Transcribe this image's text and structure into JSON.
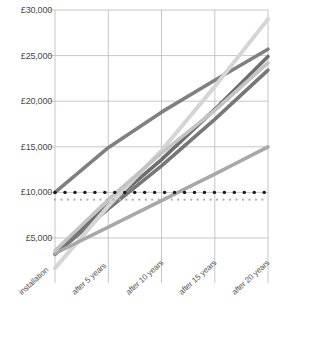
{
  "chart_data": {
    "type": "line",
    "title": "",
    "subtitle": "",
    "xlabel": "",
    "ylabel": "",
    "categories": [
      "installation",
      "after 5 years",
      "after 10 years",
      "after 15 years",
      "after 20 years"
    ],
    "x": [
      0,
      5,
      10,
      15,
      20
    ],
    "ylim": [
      0,
      30000
    ],
    "ytick_labels": [
      "£30,000",
      "£25,000",
      "£20,000",
      "£15,000",
      "£10,000",
      "£5,000"
    ],
    "ytick_values": [
      30000,
      25000,
      20000,
      15000,
      10000,
      5000
    ],
    "grid": true,
    "legend": "none",
    "currency_symbol": "£",
    "series": [
      {
        "name": "series-1-dark-gray-steep-from-10000",
        "color": "#808080",
        "style": "solid",
        "width": 3.6,
        "values": [
          10000,
          14900,
          18800,
          22300,
          25700
        ]
      },
      {
        "name": "series-2-dark-gray-from-3300",
        "color": "#6e6e6e",
        "style": "solid",
        "width": 3.6,
        "values": [
          3300,
          8600,
          13600,
          19100,
          24900
        ]
      },
      {
        "name": "series-3-medium-gray-from-3200",
        "color": "#777777",
        "style": "solid",
        "width": 3.6,
        "values": [
          3200,
          8200,
          12900,
          18000,
          23400
        ]
      },
      {
        "name": "series-4-light-gray-steepest",
        "color": "#d5d5d5",
        "style": "solid",
        "width": 4.0,
        "values": [
          1700,
          8500,
          14600,
          21600,
          29000
        ]
      },
      {
        "name": "series-5-mid-gray-shallow-to-15000",
        "color": "#a8a8a8",
        "style": "solid",
        "width": 3.6,
        "values": [
          3300,
          6200,
          9100,
          12000,
          15000
        ]
      },
      {
        "name": "series-6-light-gray-crossing",
        "color": "#c4c4c4",
        "style": "solid",
        "width": 3.6,
        "values": [
          3600,
          9200,
          14300,
          19000,
          24200
        ]
      },
      {
        "name": "series-7-dotted-flat-10000",
        "color": "#1a1a1a",
        "style": "dotted",
        "width": 3.4,
        "values": [
          10000,
          10000,
          10000,
          10000,
          10000
        ]
      },
      {
        "name": "series-8-dotted-flat-9200",
        "color": "#b0b0b0",
        "style": "dotted",
        "width": 2.2,
        "values": [
          9200,
          9200,
          9200,
          9200,
          9200
        ]
      }
    ]
  },
  "axes": {
    "plot_left_px": 55,
    "plot_right_px": 268,
    "plot_top_px": 10,
    "plot_bottom_px": 283,
    "gridline_color": "#b9b9b9",
    "background": "#ffffff"
  }
}
